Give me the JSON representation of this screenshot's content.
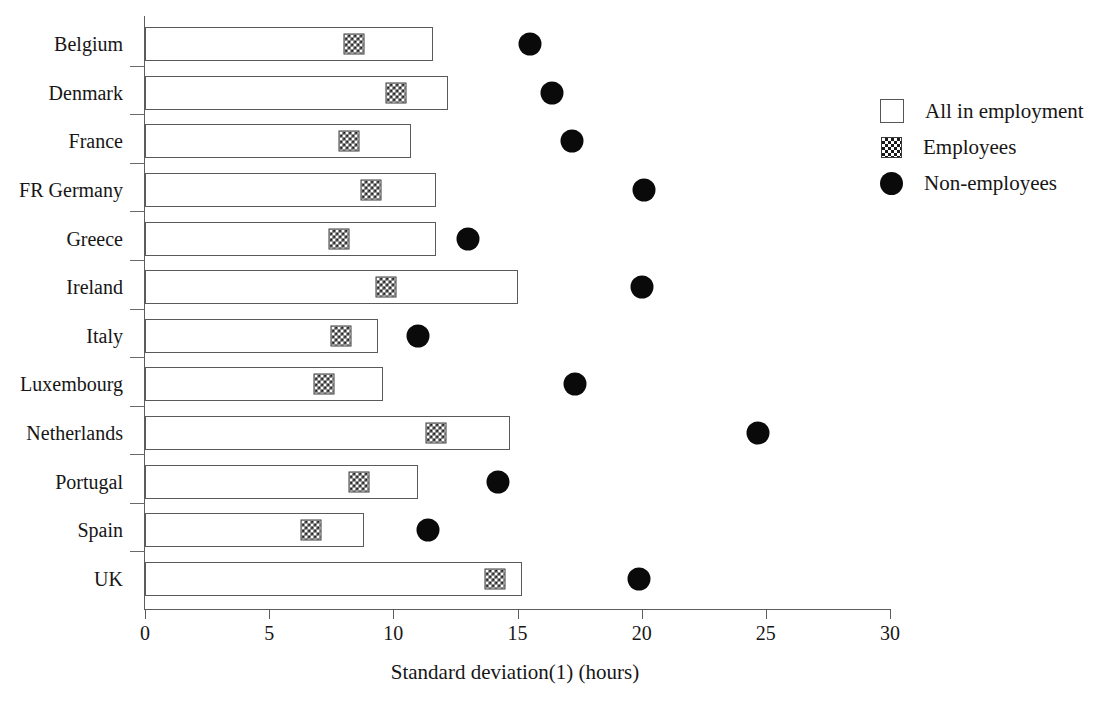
{
  "chart_data": {
    "type": "bar",
    "title": "",
    "xlabel": "Standard deviation(1) (hours)",
    "ylabel": "",
    "xlim": [
      0,
      30
    ],
    "xticks": [
      0,
      5,
      10,
      15,
      20,
      25,
      30
    ],
    "grid": false,
    "legend_position": "top-right",
    "orientation": "horizontal",
    "categories": [
      "Belgium",
      "Denmark",
      "France",
      "FR Germany",
      "Greece",
      "Ireland",
      "Italy",
      "Luxembourg",
      "Netherlands",
      "Portugal",
      "Spain",
      "UK"
    ],
    "series": [
      {
        "name": "All in employment",
        "marker": "open-bar",
        "values": [
          11.6,
          12.2,
          10.7,
          11.7,
          11.7,
          15.0,
          9.4,
          9.6,
          14.7,
          11.0,
          8.8,
          15.2
        ]
      },
      {
        "name": "Employees",
        "marker": "checkered-square",
        "values": [
          8.4,
          10.1,
          8.2,
          9.1,
          7.8,
          9.7,
          7.9,
          7.2,
          11.7,
          8.6,
          6.7,
          14.1
        ]
      },
      {
        "name": "Non-employees",
        "marker": "filled-circle",
        "values": [
          15.5,
          16.4,
          17.2,
          20.1,
          13.0,
          20.0,
          11.0,
          17.3,
          24.7,
          14.2,
          11.4,
          19.9
        ]
      }
    ]
  },
  "legend": {
    "items": [
      {
        "label": "All in employment",
        "symbol": "open-square-icon"
      },
      {
        "label": "Employees",
        "symbol": "checkered-square-icon"
      },
      {
        "label": "Non-employees",
        "symbol": "filled-circle-icon"
      }
    ]
  },
  "axis": {
    "x_title": "Standard deviation(1) (hours)",
    "x_tick_labels": [
      "0",
      "5",
      "10",
      "15",
      "20",
      "25",
      "30"
    ]
  }
}
